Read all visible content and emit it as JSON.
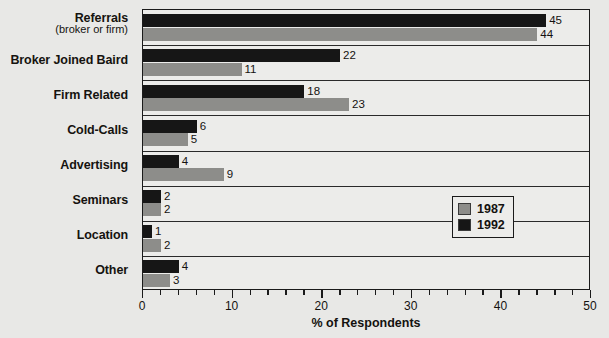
{
  "chart_data": {
    "type": "bar",
    "orientation": "horizontal",
    "title": "",
    "xlabel": "% of Respondents",
    "ylabel": "",
    "xlim": [
      0,
      50
    ],
    "xticks": [
      0,
      10,
      20,
      30,
      40,
      50
    ],
    "xtick_labels": [
      "0",
      "10",
      "20",
      "30",
      "40",
      "50"
    ],
    "minor_tick_step": 2,
    "grid": true,
    "legend_position": "inside-right",
    "categories": [
      "Referrals",
      "Broker Joined Baird",
      "Firm Related",
      "Cold-Calls",
      "Advertising",
      "Seminars",
      "Location",
      "Other"
    ],
    "category_sublabels": [
      "(broker or firm)",
      "",
      "",
      "",
      "",
      "",
      "",
      ""
    ],
    "series": [
      {
        "name": "1992",
        "color": "#161616",
        "values": [
          45,
          22,
          18,
          6,
          4,
          2,
          1,
          4
        ]
      },
      {
        "name": "1987",
        "color": "#8d8d8a",
        "values": [
          44,
          11,
          23,
          5,
          9,
          2,
          2,
          3
        ]
      }
    ]
  },
  "legend": {
    "entries": [
      {
        "label": "1987",
        "color": "#8d8d8a"
      },
      {
        "label": "1992",
        "color": "#161616"
      }
    ]
  },
  "axis": {
    "xlabel": "% of Respondents"
  }
}
